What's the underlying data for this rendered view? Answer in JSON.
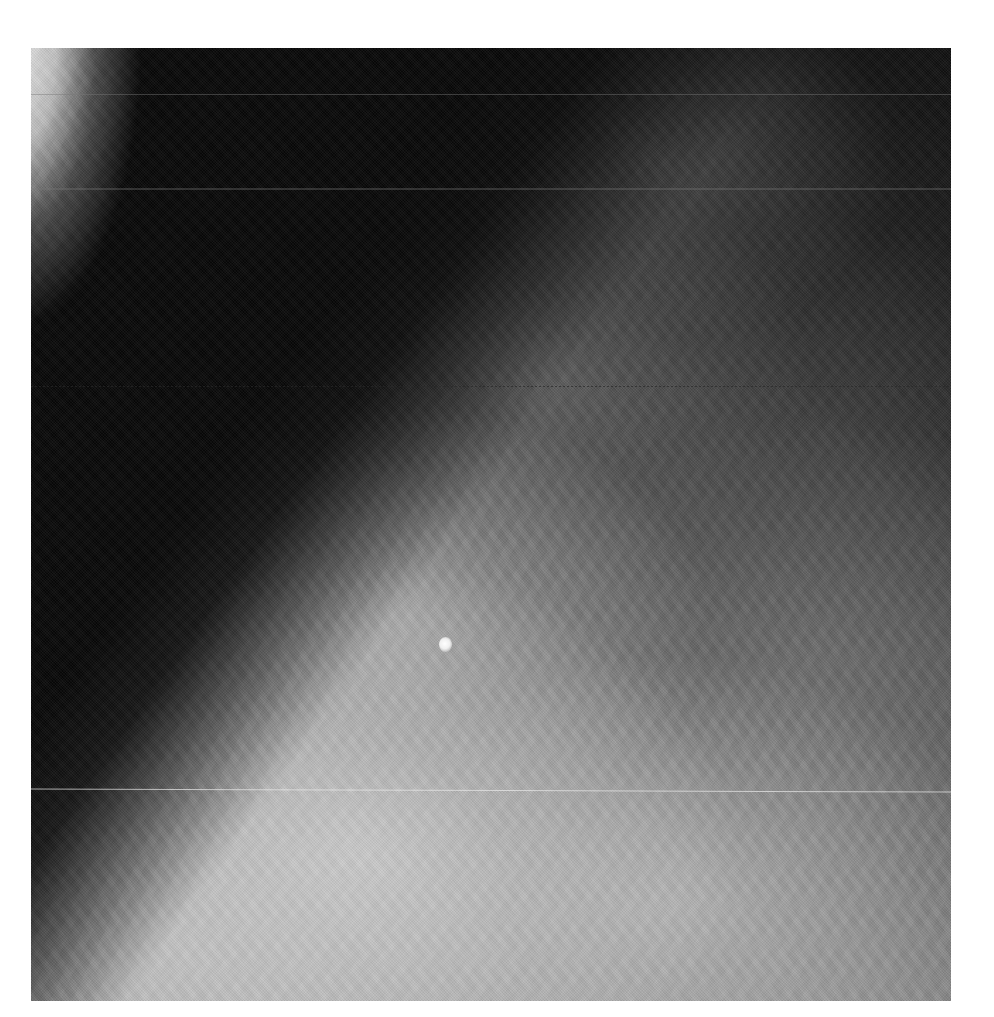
{
  "image": {
    "description": "Grayscale mammogram radiograph on white background",
    "frame": {
      "left": 31,
      "top": 48,
      "width": 920,
      "height": 953
    },
    "colors": {
      "background": "#ffffff",
      "air_region": "#0a0a0a",
      "dense_tissue": "#cdcdcd",
      "skin_edge": "#f0f0f0"
    },
    "features": [
      {
        "name": "skin-edge-arc",
        "position": "top-left corner"
      },
      {
        "name": "dark-air-region",
        "position": "upper-left"
      },
      {
        "name": "calcification",
        "position": {
          "x": 445,
          "y": 645
        }
      },
      {
        "name": "scanner-line",
        "y": 95
      },
      {
        "name": "scanner-line",
        "y": 190
      },
      {
        "name": "scanner-line-dotted",
        "y": 388
      },
      {
        "name": "scanner-line-bright",
        "y": 792
      }
    ]
  }
}
